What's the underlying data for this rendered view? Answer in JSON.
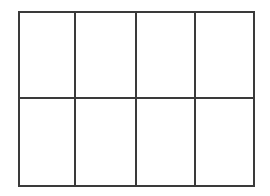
{
  "canvas": {
    "width": 270,
    "height": 196,
    "background_color": "#ffffff"
  },
  "grid": {
    "name": "empty-grid-table",
    "rows": 2,
    "columns": 4,
    "cell_count": 8,
    "line_color": "#3a3a3a",
    "line_width_px": 2,
    "cell_background_color": "#ffffff",
    "bounds": {
      "left": 18,
      "top": 11,
      "width": 237,
      "height": 176
    },
    "vertical_divider_x": [
      74,
      136,
      196
    ],
    "horizontal_divider_y": [
      98
    ],
    "cells": [
      [
        {
          "name": "cell-r1c1",
          "text": ""
        },
        {
          "name": "cell-r1c2",
          "text": ""
        },
        {
          "name": "cell-r1c3",
          "text": ""
        },
        {
          "name": "cell-r1c4",
          "text": ""
        }
      ],
      [
        {
          "name": "cell-r2c1",
          "text": ""
        },
        {
          "name": "cell-r2c2",
          "text": ""
        },
        {
          "name": "cell-r2c3",
          "text": ""
        },
        {
          "name": "cell-r2c4",
          "text": ""
        }
      ]
    ]
  }
}
